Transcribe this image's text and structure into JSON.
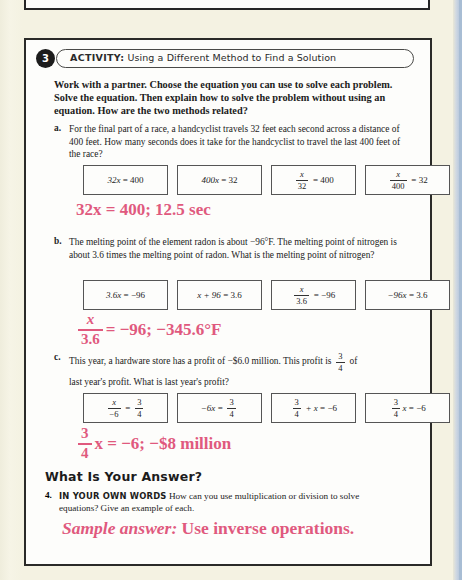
{
  "activity": {
    "number": "3",
    "label": "ACTIVITY:",
    "title": "Using a Different Method to Find a Solution",
    "intro": "Work with a partner. Choose the equation you can use to solve each problem. Solve the equation. Then explain how to solve the problem without using an equation. How are the two methods related?"
  },
  "problems": [
    {
      "label": "a.",
      "text": "For the final part of a race, a handcyclist travels 32 feet each second across a distance of 400 feet. How many seconds does it take for the handcyclist to travel the last 400 feet of the race?",
      "choices": [
        {
          "kind": "plain",
          "left": "32x",
          "op": "=",
          "right": "400"
        },
        {
          "kind": "plain",
          "left": "400x",
          "op": "=",
          "right": "32"
        },
        {
          "kind": "frac-left",
          "num": "x",
          "den": "32",
          "op": "=",
          "right": "400"
        },
        {
          "kind": "frac-left",
          "num": "x",
          "den": "400",
          "op": "=",
          "right": "32"
        }
      ],
      "answer": {
        "kind": "plain",
        "text": "32x = 400; 12.5 sec"
      }
    },
    {
      "label": "b.",
      "text": "The melting point of the element radon is about −96°F. The melting point of nitrogen is about 3.6 times the melting point of radon. What is the melting point of nitrogen?",
      "choices": [
        {
          "kind": "plain",
          "left": "3.6x",
          "op": "=",
          "right": "−96"
        },
        {
          "kind": "plain",
          "left": "x + 96",
          "op": "=",
          "right": "3.6"
        },
        {
          "kind": "frac-left",
          "num": "x",
          "den": "3.6",
          "op": "=",
          "right": "−96"
        },
        {
          "kind": "plain",
          "left": "−96x",
          "op": "=",
          "right": "3.6"
        }
      ],
      "answer": {
        "kind": "frac-left",
        "num": "x",
        "den": "3.6",
        "rest": "= −96; −345.6°F"
      }
    },
    {
      "label": "c.",
      "text_pre": "This year, a hardware store has a profit of −$6.0 million. This profit is",
      "text_frac": {
        "num": "3",
        "den": "4"
      },
      "text_mid": "of",
      "text_post": "last year's profit. What is last year's profit?",
      "choices": [
        {
          "kind": "frac-eq-frac",
          "lnum": "x",
          "lden": "−6",
          "op": "=",
          "rnum": "3",
          "rden": "4"
        },
        {
          "kind": "plain-eq-frac",
          "left": "−6x",
          "op": "=",
          "rnum": "3",
          "rden": "4"
        },
        {
          "kind": "frac-plus",
          "lnum": "3",
          "lden": "4",
          "mid": "+ x",
          "op": "=",
          "right": "−6"
        },
        {
          "kind": "frac-coef",
          "lnum": "3",
          "lden": "4",
          "var": "x",
          "op": "=",
          "right": "−6"
        }
      ],
      "answer": {
        "kind": "frac-coef",
        "num": "3",
        "den": "4",
        "rest": "x = −6; −$8 million"
      }
    }
  ],
  "what_is_your_answer": {
    "heading": "What Is Your Answer?",
    "question_number": "4.",
    "caps_lead": "IN YOUR OWN WORDS",
    "question_text": "How can you use multiplication or division to solve equations? Give an example of each.",
    "sample_italic": "Sample answer:",
    "sample_rest": "Use inverse operations."
  },
  "colors": {
    "answer_red": "#e0597e",
    "page_bg": "#f4f2e2",
    "box_bg": "#fdfdfb",
    "border": "#2a2a28",
    "right_strip": "#a8bdd4"
  }
}
